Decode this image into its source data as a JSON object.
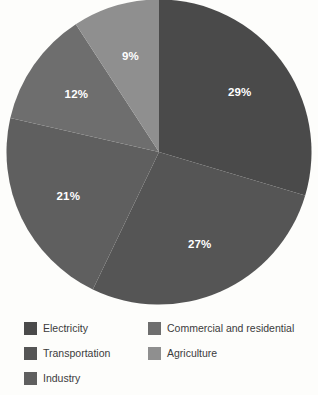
{
  "chart_data": {
    "type": "pie",
    "title": "",
    "subtitle": "",
    "xlabel": "",
    "ylabel": "",
    "grid": false,
    "legend_position": "bottom",
    "start_angle_deg": 0,
    "direction": "clockwise",
    "value_suffix": "%",
    "categories": [
      "Electricity",
      "Transportation",
      "Industry",
      "Commercial and residential",
      "Agriculture"
    ],
    "values": [
      29,
      27,
      21,
      12,
      9
    ],
    "labels": [
      "29%",
      "27%",
      "21%",
      "12%",
      "9%"
    ],
    "colors": [
      "#4a4a4a",
      "#555555",
      "#5f5f5f",
      "#6e6e6e",
      "#8f8f8f"
    ],
    "slices": [
      {
        "name": "Electricity",
        "value": 29,
        "label": "29%",
        "color": "#4a4a4a"
      },
      {
        "name": "Transportation",
        "value": 27,
        "label": "27%",
        "color": "#555555"
      },
      {
        "name": "Industry",
        "value": 21,
        "label": "21%",
        "color": "#5f5f5f"
      },
      {
        "name": "Commercial and residential",
        "value": 12,
        "label": "12%",
        "color": "#6e6e6e"
      },
      {
        "name": "Agriculture",
        "value": 9,
        "label": "9%",
        "color": "#8f8f8f"
      }
    ]
  },
  "legend": {
    "columns": [
      {
        "items": [
          {
            "label": "Electricity",
            "color": "#4a4a4a"
          },
          {
            "label": "Transportation",
            "color": "#555555"
          },
          {
            "label": "Industry",
            "color": "#5f5f5f"
          }
        ]
      },
      {
        "items": [
          {
            "label": "Commercial and residential",
            "color": "#6e6e6e"
          },
          {
            "label": "Agriculture",
            "color": "#8f8f8f"
          }
        ]
      }
    ]
  }
}
